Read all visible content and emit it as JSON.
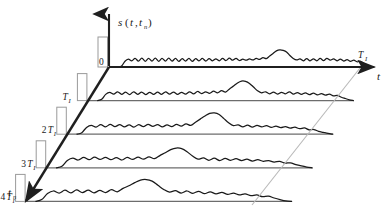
{
  "figure": {
    "title": "",
    "background_color": "#ffffff",
    "axes": {
      "vertical": {
        "name": "signal-amplitude-axis",
        "label_main": "s",
        "label_args_open": "(",
        "label_arg1": "t",
        "label_comma": ",",
        "label_arg2": "t",
        "label_arg2_sub": "n",
        "label_args_close": ")",
        "label_full": "s(t,tₙ)"
      },
      "horizontal": {
        "name": "fast-time-axis",
        "label": "t",
        "end_tick_label": "T",
        "end_tick_sub": "I",
        "end_tick_full": "Tᵢ"
      },
      "depth": {
        "name": "slow-time-axis",
        "label": "t",
        "label_sub": "n",
        "label_full": "tₙ"
      }
    },
    "origin_label": "0",
    "depth_ticks": [
      {
        "base": "",
        "sym": "T",
        "sub": "I",
        "full": "Tᵢ"
      },
      {
        "base": "2",
        "sym": "T",
        "sub": "I",
        "full": "2Tᵢ"
      },
      {
        "base": "3",
        "sym": "T",
        "sub": "I",
        "full": "3Tᵢ"
      },
      {
        "base": "4",
        "sym": "T",
        "sub": "I",
        "full": "4Tᵢ"
      }
    ],
    "colors": {
      "axis": "#1f1f1f",
      "trace": "#1a1a1a",
      "baseline": "#6d6d6d",
      "pulse_rect_stroke": "#9a9a9a",
      "guide_line": "#b9b9b9",
      "text": "#1a1a1a"
    },
    "sweeps": [
      {
        "index": 0,
        "depth_label": "0",
        "peak_position": 0.7,
        "pulse_height": 30
      },
      {
        "index": 1,
        "depth_label": "Tᵢ",
        "peak_position": 0.655,
        "pulse_height": 27
      },
      {
        "index": 2,
        "depth_label": "2Tᵢ",
        "peak_position": 0.6,
        "pulse_height": 27
      },
      {
        "index": 3,
        "depth_label": "3Tᵢ",
        "peak_position": 0.545,
        "pulse_height": 27
      },
      {
        "index": 4,
        "depth_label": "4Tᵢ",
        "peak_position": 0.495,
        "pulse_height": 27
      }
    ]
  },
  "chart_data": {
    "type": "line",
    "title": "",
    "xlabel": "t",
    "ylabel": "s(t,tₙ)",
    "zlabel": "tₙ",
    "grid": false,
    "legend": "none",
    "projection": "oblique-3d-stacked-sweeps",
    "x_axis_end_label": "Tᵢ",
    "z_tick_labels": [
      "0",
      "Tᵢ",
      "2Tᵢ",
      "3Tᵢ",
      "4Tᵢ"
    ],
    "n_sweeps": 5,
    "series": [
      {
        "name": "sweep-0",
        "z": "0",
        "peak_x_fraction": 0.7,
        "values": [
          0,
          0.04,
          0.22,
          0.3,
          0.24,
          0.33,
          0.23,
          0.34,
          0.22,
          0.33,
          0.23,
          0.34,
          0.22,
          0.33,
          0.23,
          0.34,
          0.23,
          0.33,
          0.22,
          0.32,
          0.23,
          0.33,
          0.22,
          0.32,
          0.24,
          0.33,
          0.23,
          0.32,
          0.24,
          0.31,
          0.24,
          0.33,
          0.25,
          0.34,
          0.26,
          0.33,
          0.25,
          0.3,
          0.26,
          0.31,
          0.27,
          0.33,
          0.29,
          0.36,
          0.32,
          0.42,
          0.52,
          0.62,
          0.66,
          0.64,
          0.58,
          0.44,
          0.33,
          0.27,
          0.31,
          0.24,
          0.32,
          0.24,
          0.31,
          0.24,
          0.33,
          0.25,
          0.33,
          0.26,
          0.31,
          0.24,
          0.3,
          0.23,
          0.28,
          0.22,
          0.26,
          0.2,
          0.22,
          0.14,
          0.07,
          0.02,
          0.0
        ]
      },
      {
        "name": "sweep-1",
        "z": "Tᵢ",
        "peak_x_fraction": 0.655,
        "values": [
          0,
          0.05,
          0.24,
          0.32,
          0.25,
          0.34,
          0.24,
          0.33,
          0.23,
          0.34,
          0.24,
          0.33,
          0.23,
          0.32,
          0.24,
          0.33,
          0.24,
          0.34,
          0.25,
          0.33,
          0.24,
          0.32,
          0.25,
          0.34,
          0.26,
          0.35,
          0.27,
          0.34,
          0.28,
          0.36,
          0.3,
          0.38,
          0.33,
          0.45,
          0.56,
          0.68,
          0.75,
          0.74,
          0.66,
          0.52,
          0.38,
          0.3,
          0.34,
          0.26,
          0.33,
          0.25,
          0.32,
          0.26,
          0.34,
          0.25,
          0.31,
          0.24,
          0.3,
          0.23,
          0.29,
          0.22,
          0.27,
          0.21,
          0.25,
          0.18,
          0.2,
          0.13,
          0.08,
          0.03,
          0.0
        ]
      },
      {
        "name": "sweep-2",
        "z": "2Tᵢ",
        "peak_x_fraction": 0.6,
        "values": [
          0,
          0.06,
          0.26,
          0.34,
          0.27,
          0.37,
          0.28,
          0.38,
          0.29,
          0.37,
          0.28,
          0.36,
          0.27,
          0.37,
          0.29,
          0.38,
          0.3,
          0.37,
          0.28,
          0.36,
          0.29,
          0.38,
          0.31,
          0.4,
          0.34,
          0.46,
          0.58,
          0.7,
          0.8,
          0.82,
          0.76,
          0.6,
          0.44,
          0.33,
          0.36,
          0.28,
          0.35,
          0.27,
          0.34,
          0.28,
          0.33,
          0.26,
          0.31,
          0.25,
          0.29,
          0.23,
          0.27,
          0.21,
          0.24,
          0.17,
          0.18,
          0.11,
          0.07,
          0.03,
          0.0
        ]
      },
      {
        "name": "sweep-3",
        "z": "3Tᵢ",
        "peak_x_fraction": 0.545,
        "values": [
          0,
          0.06,
          0.28,
          0.37,
          0.3,
          0.4,
          0.31,
          0.41,
          0.32,
          0.4,
          0.31,
          0.39,
          0.3,
          0.4,
          0.32,
          0.41,
          0.33,
          0.42,
          0.35,
          0.47,
          0.58,
          0.7,
          0.76,
          0.74,
          0.62,
          0.45,
          0.33,
          0.38,
          0.29,
          0.37,
          0.28,
          0.36,
          0.29,
          0.35,
          0.28,
          0.33,
          0.26,
          0.31,
          0.25,
          0.28,
          0.22,
          0.25,
          0.18,
          0.19,
          0.12,
          0.07,
          0.03,
          0.0
        ]
      },
      {
        "name": "sweep-4",
        "z": "4Tᵢ",
        "peak_x_fraction": 0.495,
        "values": [
          0,
          0.07,
          0.3,
          0.4,
          0.32,
          0.43,
          0.33,
          0.44,
          0.34,
          0.43,
          0.33,
          0.42,
          0.34,
          0.45,
          0.37,
          0.5,
          0.6,
          0.72,
          0.82,
          0.84,
          0.78,
          0.62,
          0.46,
          0.36,
          0.41,
          0.32,
          0.4,
          0.31,
          0.39,
          0.3,
          0.37,
          0.29,
          0.35,
          0.27,
          0.32,
          0.25,
          0.29,
          0.22,
          0.25,
          0.18,
          0.2,
          0.13,
          0.07,
          0.02,
          0.0
        ]
      }
    ]
  }
}
